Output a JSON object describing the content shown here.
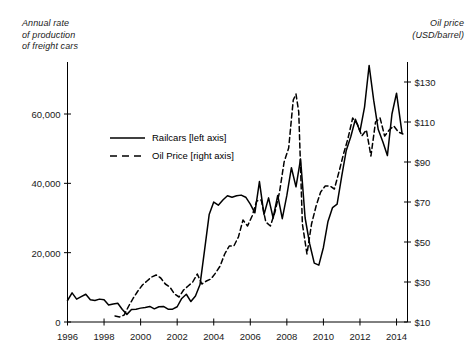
{
  "chart_data": {
    "type": "line",
    "title": "",
    "xlabel": "",
    "ylabel": "Annual rate\nof production\nof freight cars",
    "y2label": "Oil price\n(USD/barrel)",
    "grid": false,
    "legend_position": "upper-left-inside",
    "xlim": [
      1996,
      2014.6
    ],
    "ylim": [
      0,
      75000
    ],
    "y2lim": [
      10,
      140
    ],
    "xticks": [
      1996,
      1998,
      2000,
      2002,
      2004,
      2006,
      2008,
      2010,
      2012,
      2014
    ],
    "xticklabels": [
      "1996",
      "1998",
      "2000",
      "2002",
      "2004",
      "2006",
      "2008",
      "2010",
      "2012",
      "2014"
    ],
    "yticks": [
      0,
      20000,
      40000,
      60000
    ],
    "yticklabels": [
      "0",
      "20,000",
      "40,000",
      "60,000"
    ],
    "y2ticks": [
      10,
      30,
      50,
      70,
      90,
      110,
      130
    ],
    "y2ticklabels": [
      "$10",
      "$30",
      "$50",
      "$70",
      "$90",
      "$110",
      "$130"
    ],
    "series": [
      {
        "name": "Railcars [left axis]",
        "axis": "left",
        "style": "solid",
        "color": "#000000",
        "x": [
          1996.0,
          1996.25,
          1996.5,
          1996.75,
          1997.0,
          1997.25,
          1997.5,
          1997.75,
          1998.0,
          1998.25,
          1998.5,
          1998.75,
          1999.0,
          1999.25,
          1999.5,
          1999.75,
          2000.0,
          2000.25,
          2000.5,
          2000.75,
          2001.0,
          2001.25,
          2001.5,
          2001.75,
          2002.0,
          2002.25,
          2002.5,
          2002.75,
          2003.0,
          2003.25,
          2003.5,
          2003.75,
          2004.0,
          2004.25,
          2004.5,
          2004.75,
          2005.0,
          2005.25,
          2005.5,
          2005.75,
          2006.0,
          2006.25,
          2006.5,
          2006.75,
          2007.0,
          2007.25,
          2007.5,
          2007.75,
          2008.0,
          2008.25,
          2008.5,
          2008.75,
          2009.0,
          2009.25,
          2009.5,
          2009.75,
          2010.0,
          2010.25,
          2010.5,
          2010.75,
          2011.0,
          2011.25,
          2011.5,
          2011.75,
          2012.0,
          2012.25,
          2012.5,
          2012.75,
          2013.0,
          2013.25,
          2013.5,
          2013.75,
          2014.0,
          2014.3
        ],
        "values": [
          6200,
          8400,
          6600,
          7300,
          8000,
          6400,
          6200,
          6600,
          6400,
          4900,
          5200,
          5400,
          3600,
          2200,
          3600,
          3700,
          4000,
          4200,
          4500,
          3800,
          4400,
          4500,
          3700,
          3700,
          4400,
          6800,
          8000,
          5900,
          7500,
          10800,
          20800,
          31000,
          34600,
          33700,
          35200,
          36400,
          36000,
          36400,
          36600,
          36000,
          34000,
          31500,
          40500,
          31000,
          35800,
          30000,
          36500,
          29800,
          36500,
          44500,
          39000,
          47000,
          30000,
          22500,
          17000,
          16400,
          21500,
          29000,
          33000,
          34000,
          42000,
          49500,
          53500,
          58500,
          55000,
          62000,
          74000,
          64000,
          55500,
          52000,
          48000,
          60000,
          66000,
          54500
        ]
      },
      {
        "name": "Oil Price [right axis]",
        "axis": "right",
        "style": "dashed",
        "color": "#000000",
        "x": [
          1998.6,
          1998.85,
          1999.1,
          1999.35,
          1999.6,
          1999.85,
          2000.1,
          2000.35,
          2000.6,
          2000.85,
          2001.1,
          2001.35,
          2001.6,
          2001.85,
          2002.1,
          2002.35,
          2002.6,
          2002.85,
          2003.1,
          2003.35,
          2003.6,
          2003.85,
          2004.1,
          2004.35,
          2004.6,
          2004.85,
          2005.1,
          2005.35,
          2005.6,
          2005.85,
          2006.1,
          2006.35,
          2006.6,
          2006.85,
          2007.1,
          2007.35,
          2007.6,
          2007.85,
          2008.1,
          2008.35,
          2008.5,
          2008.65,
          2008.85,
          2009.1,
          2009.35,
          2009.6,
          2009.85,
          2010.1,
          2010.35,
          2010.6,
          2010.85,
          2011.1,
          2011.35,
          2011.6,
          2011.85,
          2012.1,
          2012.35,
          2012.6,
          2012.85,
          2013.1,
          2013.35,
          2013.6,
          2013.85,
          2014.1,
          2014.35
        ],
        "values": [
          13.0,
          12.5,
          13.5,
          18.0,
          22.0,
          25.5,
          28.5,
          30.5,
          32.5,
          33.5,
          32.0,
          29.0,
          27.5,
          24.0,
          22.5,
          26.0,
          28.0,
          30.0,
          34.0,
          29.0,
          30.5,
          31.5,
          34.5,
          38.0,
          44.0,
          48.0,
          48.0,
          52.5,
          61.0,
          58.0,
          63.0,
          70.5,
          71.0,
          60.0,
          58.0,
          65.0,
          75.0,
          90.0,
          97.0,
          121.0,
          124.0,
          115.0,
          59.0,
          44.0,
          59.0,
          68.0,
          75.0,
          78.0,
          78.0,
          76.5,
          85.0,
          94.0,
          102.0,
          112.0,
          109.0,
          103.0,
          106.0,
          93.0,
          110.0,
          112.0,
          103.0,
          106.0,
          108.0,
          105.0,
          104.0
        ]
      }
    ]
  },
  "legend": {
    "items": [
      {
        "label": "Railcars [left axis]",
        "style": "solid"
      },
      {
        "label": "Oil Price [right axis]",
        "style": "dashed"
      }
    ]
  }
}
